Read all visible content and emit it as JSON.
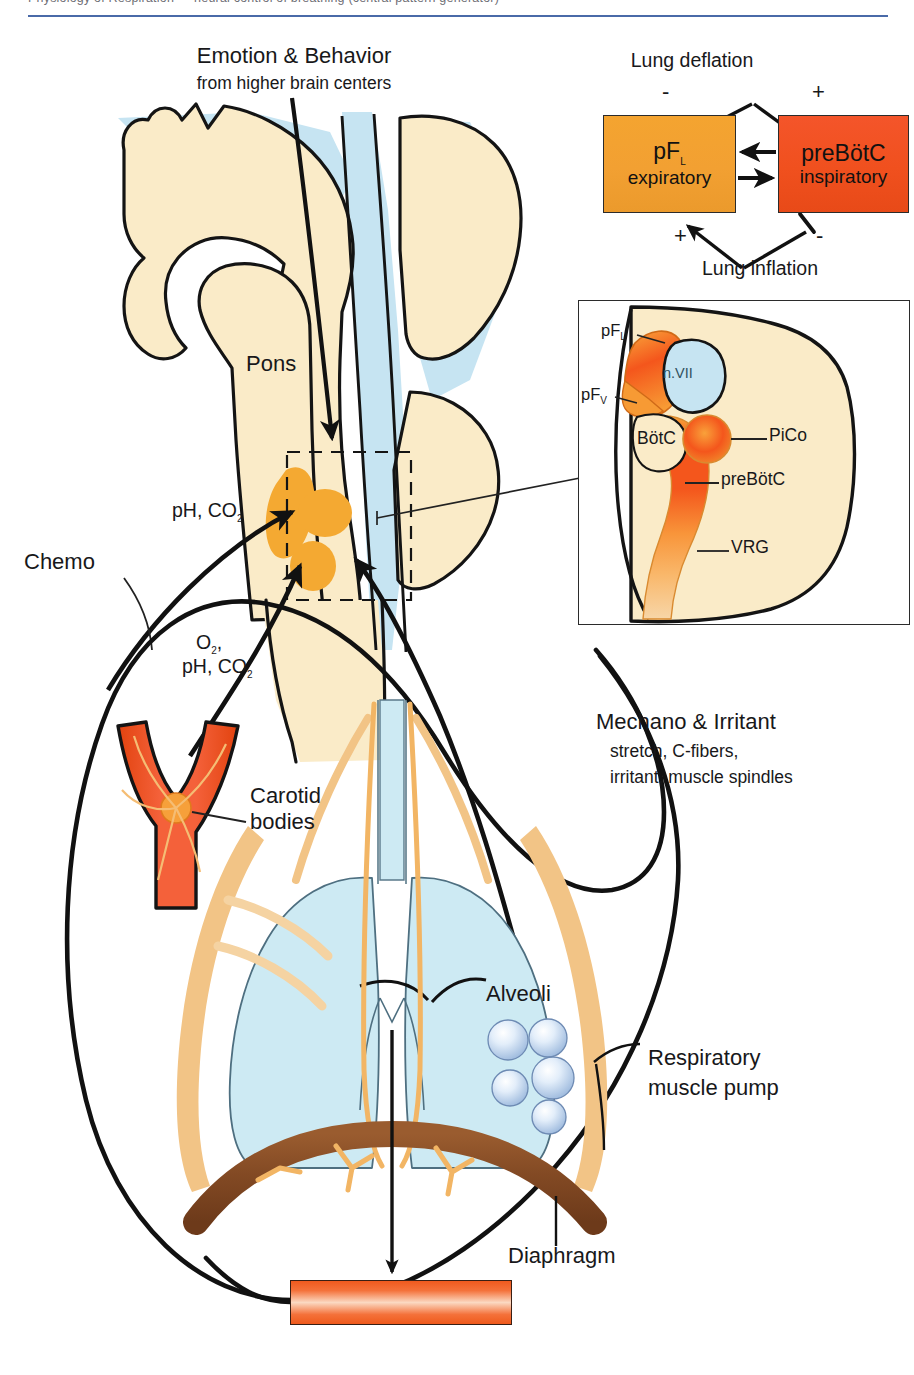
{
  "header": {
    "text": "Physiology of Respiration — neural control of breathing (central pattern generator)"
  },
  "figure": {
    "type": "anatomical-schematic"
  },
  "top_label": {
    "line1": "Emotion & Behavior",
    "line2": "from higher brain centers"
  },
  "brain": {
    "pons_label": "Pons",
    "chemo_label": "Chemo",
    "central_chemo_line1": "pH, CO",
    "central_chemo_sub": "2",
    "peripheral_line1": "O",
    "peripheral_sub1": "2",
    "peripheral_comma": ",",
    "peripheral_line2": "pH, CO",
    "peripheral_sub2": "2"
  },
  "block_diagram": {
    "lung_deflation": "Lung deflation",
    "lung_inflation": "Lung inflation",
    "deflation_minus": "-",
    "deflation_plus": "+",
    "inflation_plus": "+",
    "inflation_minus": "-",
    "left_box": {
      "name": "pF",
      "subscript": "L",
      "role": "expiratory",
      "color": "#f2a032"
    },
    "right_box": {
      "name": "preBötC",
      "role": "inspiratory",
      "color": "#f0501e"
    }
  },
  "inset": {
    "labels": {
      "pfl": "pF",
      "pfl_sub": "L",
      "pfv": "pF",
      "pfv_sub": "V",
      "nvii": "n.VII",
      "botc": "BötC",
      "pico": "PiCo",
      "prebotc": "preBötC",
      "vrg": "VRG"
    }
  },
  "body": {
    "carotid_line1": "Carotid",
    "carotid_line2": "bodies",
    "mechano_title": "Mechano & Irritant",
    "mechano_line1": "stretch, C-fibers,",
    "mechano_line2": "irritant, muscle spindles",
    "alveoli": "Alveoli",
    "resp_pump_line1": "Respiratory",
    "resp_pump_line2": "muscle pump",
    "diaphragm": "Diaphragm"
  },
  "colors": {
    "brain_tissue": "#faebc8",
    "ventricle_blue": "#c6e4f2",
    "lung_blue": "#cdeaf3",
    "nerve_tan": "#f2c486",
    "diaphragm_brown": "#8a4f28",
    "artery_red": "#f04a1e",
    "medulla_orange": "#f4a932",
    "accent_rule": "#4a6aa8",
    "outline": "#141414"
  }
}
